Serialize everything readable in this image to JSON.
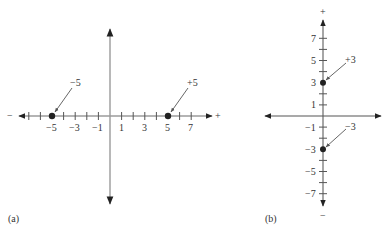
{
  "panel_a": {
    "caption": "(a)",
    "minus_sign": "−",
    "plus_sign": "+",
    "tick_labels": [
      "−5",
      "−3",
      "−1",
      "1",
      "3",
      "5",
      "7"
    ],
    "points": [
      {
        "value": -5,
        "label": "−5"
      },
      {
        "value": 5,
        "label": "+5"
      }
    ]
  },
  "panel_b": {
    "caption": "(b)",
    "plus_sign": "+",
    "minus_sign": "−",
    "tick_labels": [
      "7",
      "5",
      "3",
      "1",
      "−1",
      "−3",
      "−5",
      "−7"
    ],
    "points": [
      {
        "value": 3,
        "label": "+3"
      },
      {
        "value": -3,
        "label": "−3"
      }
    ]
  },
  "colors": {
    "axis": "#6b6b6b",
    "ink": "#222222"
  }
}
